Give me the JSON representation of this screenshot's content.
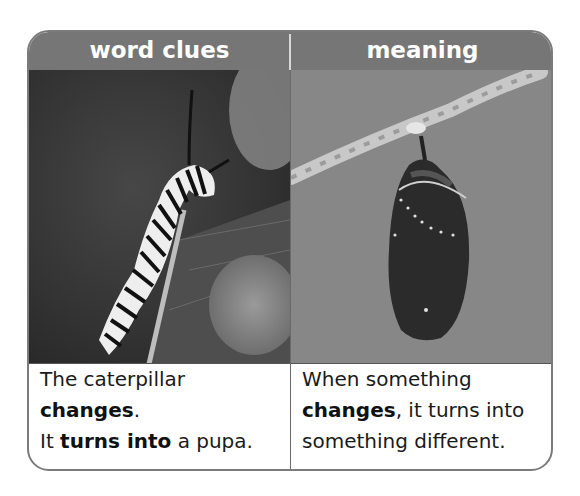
{
  "table": {
    "headers": [
      "word clues",
      "meaning"
    ],
    "images": [
      {
        "label": "caterpillar on leaf",
        "alt": "Black-and-white photo of a striped caterpillar on a leaf"
      },
      {
        "label": "chrysalis hanging from twig",
        "alt": "Black-and-white photo of a chrysalis (pupa) hanging from a branch"
      }
    ],
    "word_clues": {
      "line1_plain": "The caterpillar ",
      "line1_bold": "changes",
      "line1_end": ".",
      "line2_start": "It ",
      "line2_bold": "turns into",
      "line2_end": " a pupa."
    },
    "meaning": {
      "line1": "When something",
      "line2_bold": "changes",
      "line2_end": ", it turns into",
      "line3": "something different."
    }
  },
  "colors": {
    "header_bg": "#767676",
    "header_text": "#ffffff",
    "border": "#7b7b7b"
  }
}
